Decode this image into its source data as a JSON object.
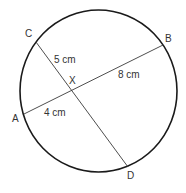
{
  "diagram": {
    "type": "intersecting-chords-in-circle",
    "points": {
      "A": "A",
      "B": "B",
      "C": "C",
      "D": "D",
      "X": "X"
    },
    "chords": [
      {
        "name": "AB",
        "from": "A",
        "to": "B"
      },
      {
        "name": "CD",
        "from": "C",
        "to": "D"
      }
    ],
    "segment_labels": {
      "CX": "5 cm",
      "XB": "8 cm",
      "AX": "4 cm"
    },
    "colors": {
      "stroke": "#1a1a1a",
      "text": "#333333",
      "background": "#ffffff"
    }
  }
}
